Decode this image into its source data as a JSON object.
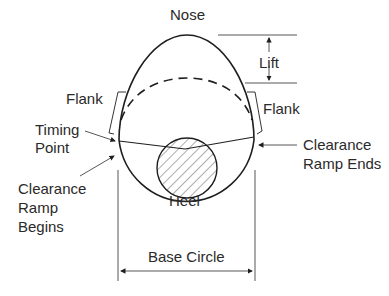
{
  "diagram": {
    "type": "cam-profile",
    "labels": {
      "nose": "Nose",
      "lift": "Lift",
      "flank_left": "Flank",
      "flank_right": "Flank",
      "timing_point_line1": "Timing",
      "timing_point_line2": "Point",
      "ramp_ends_line1": "Clearance",
      "ramp_ends_line2": "Ramp Ends",
      "ramp_begins_line1": "Clearance",
      "ramp_begins_line2": "Ramp",
      "ramp_begins_line3": "Begins",
      "heel": "Heel",
      "base_circle": "Base Circle"
    },
    "colors": {
      "line": "#1e1e1e",
      "text": "#2a2a2a",
      "background": "#ffffff"
    }
  }
}
